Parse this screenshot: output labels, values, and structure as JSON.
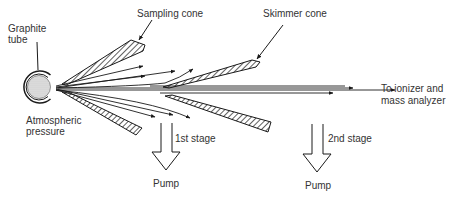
{
  "diagram": {
    "type": "ICP-MS interface schematic",
    "labels": {
      "graphite_tube_line1": "Graphite",
      "graphite_tube_line2": "tube",
      "sampling_cone": "Sampling cone",
      "skimmer_cone": "Skimmer cone",
      "atmospheric_line1": "Atmospheric",
      "atmospheric_line2": "pressure",
      "destination_line1": "To ionizer and",
      "destination_line2": "mass analyzer",
      "stage1": "1st stage",
      "stage2": "2nd stage",
      "pump1": "Pump",
      "pump2": "Pump"
    },
    "colors": {
      "line": "#1a1a1a",
      "text": "#333333",
      "background": "#ffffff",
      "tube_fill": "#d8d8d8"
    }
  }
}
